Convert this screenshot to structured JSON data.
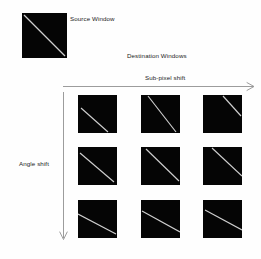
{
  "diagram": {
    "title_labels": {
      "source_window": "Source Window",
      "destination_windows": "Destination Windows",
      "subpixel_shift": "Sub-pixel shift",
      "angle_shift": "Angle shift"
    },
    "colors": {
      "background": "#fefefe",
      "window_fill": "#050505",
      "line_stroke": "#cfcfcf",
      "arrow_stroke": "#8a8a8a",
      "text": "#1b1b1b"
    },
    "source_window": {
      "name": "source-window",
      "line": {
        "x1": 2,
        "y1": 2,
        "x2": 43,
        "y2": 43
      }
    },
    "axes": {
      "horizontal": {
        "label": "Sub-pixel shift",
        "direction": "right"
      },
      "vertical": {
        "label": "Angle shift",
        "direction": "down"
      }
    },
    "grid": {
      "rows": 3,
      "cols": 3,
      "cells": [
        {
          "row": 0,
          "col": 0,
          "line": {
            "x1": 3,
            "y1": 13,
            "x2": 30,
            "y2": 37
          }
        },
        {
          "row": 0,
          "col": 1,
          "line": {
            "x1": 7,
            "y1": 1,
            "x2": 35,
            "y2": 37
          }
        },
        {
          "row": 0,
          "col": 2,
          "line": {
            "x1": 20,
            "y1": 1,
            "x2": 38,
            "y2": 21
          }
        },
        {
          "row": 1,
          "col": 0,
          "line": {
            "x1": 2,
            "y1": 6,
            "x2": 36,
            "y2": 35
          }
        },
        {
          "row": 1,
          "col": 1,
          "line": {
            "x1": 5,
            "y1": 2,
            "x2": 38,
            "y2": 34
          }
        },
        {
          "row": 1,
          "col": 2,
          "line": {
            "x1": 9,
            "y1": 1,
            "x2": 39,
            "y2": 29
          }
        },
        {
          "row": 2,
          "col": 0,
          "line": {
            "x1": 0,
            "y1": 14,
            "x2": 38,
            "y2": 34
          }
        },
        {
          "row": 2,
          "col": 1,
          "line": {
            "x1": 1,
            "y1": 11,
            "x2": 39,
            "y2": 32
          }
        },
        {
          "row": 2,
          "col": 2,
          "line": {
            "x1": 2,
            "y1": 10,
            "x2": 39,
            "y2": 30
          }
        }
      ]
    }
  }
}
